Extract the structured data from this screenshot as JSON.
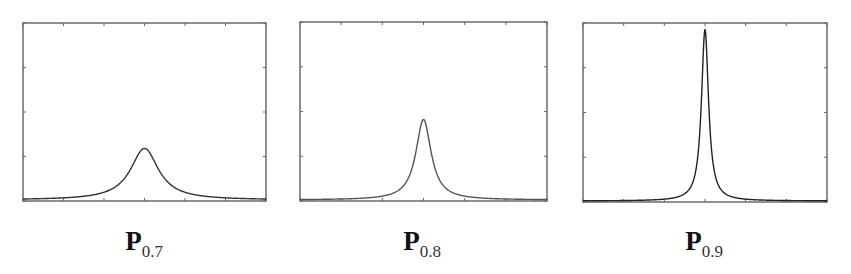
{
  "chart_data": [
    {
      "type": "line",
      "title": "",
      "caption": {
        "symbol": "P",
        "subscript": "0.7"
      },
      "xlabel": "",
      "ylabel": "",
      "xlim": [
        -1,
        1
      ],
      "ylim": [
        0,
        1
      ],
      "grid": false,
      "x_ticks": 7,
      "y_ticks": 5,
      "shape": "lorentzian peak",
      "peak_x": 0,
      "peak_y": 0.29,
      "half_width": 0.14,
      "line_color": "#333333"
    },
    {
      "type": "line",
      "title": "",
      "caption": {
        "symbol": "P",
        "subscript": "0.8"
      },
      "xlabel": "",
      "ylabel": "",
      "xlim": [
        -1,
        1
      ],
      "ylim": [
        0,
        1
      ],
      "grid": false,
      "x_ticks": 7,
      "y_ticks": 5,
      "shape": "lorentzian peak",
      "peak_x": 0,
      "peak_y": 0.45,
      "half_width": 0.075,
      "line_color": "#555555"
    },
    {
      "type": "line",
      "title": "",
      "caption": {
        "symbol": "P",
        "subscript": "0.9"
      },
      "xlabel": "",
      "ylabel": "",
      "xlim": [
        -1,
        1
      ],
      "ylim": [
        0,
        1
      ],
      "grid": false,
      "x_ticks": 7,
      "y_ticks": 5,
      "shape": "lorentzian peak",
      "peak_x": 0,
      "peak_y": 0.96,
      "half_width": 0.035,
      "line_color": "#222222"
    }
  ],
  "captions": [
    {
      "symbol": "P",
      "subscript": "0.7"
    },
    {
      "symbol": "P",
      "subscript": "0.8"
    },
    {
      "symbol": "P",
      "subscript": "0.9"
    }
  ]
}
